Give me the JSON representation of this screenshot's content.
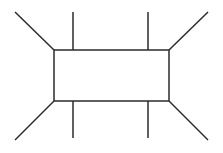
{
  "canvas": {
    "width": 223,
    "height": 153,
    "background_color": "#ffffff",
    "title": "Geometric line diagram: rectangle with radiating corner lines"
  },
  "style": {
    "stroke_color": "#2b2b2b",
    "stroke_width": 1.5,
    "rect_fill_color": "#ffffff"
  },
  "figure": {
    "type": "line-diagram",
    "rectangle": {
      "name": "center-rectangle",
      "x": 54,
      "y": 50,
      "width": 115,
      "height": 51,
      "corners": {
        "top_left": [
          54,
          50
        ],
        "top_right": [
          169,
          50
        ],
        "bottom_left": [
          54,
          101
        ],
        "bottom_right": [
          169,
          101
        ]
      }
    },
    "diagonals": [
      {
        "name": "diagonal-top-left",
        "x1": 15,
        "y1": 12,
        "x2": 54,
        "y2": 50
      },
      {
        "name": "diagonal-top-right",
        "x1": 208,
        "y1": 12,
        "x2": 169,
        "y2": 50
      },
      {
        "name": "diagonal-bottom-left",
        "x1": 15,
        "y1": 140,
        "x2": 54,
        "y2": 101
      },
      {
        "name": "diagonal-bottom-right",
        "x1": 208,
        "y1": 140,
        "x2": 169,
        "y2": 101
      }
    ],
    "verticals": [
      {
        "name": "vertical-left-upper",
        "x1": 73,
        "y1": 12,
        "x2": 73,
        "y2": 50
      },
      {
        "name": "vertical-left-lower",
        "x1": 73,
        "y1": 101,
        "x2": 73,
        "y2": 138
      },
      {
        "name": "vertical-right-upper",
        "x1": 148,
        "y1": 12,
        "x2": 148,
        "y2": 50
      },
      {
        "name": "vertical-right-lower",
        "x1": 148,
        "y1": 101,
        "x2": 148,
        "y2": 138
      }
    ]
  }
}
